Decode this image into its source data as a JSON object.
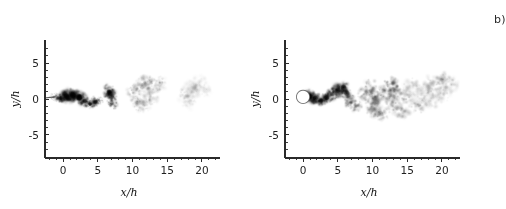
{
  "figure": {
    "type": "flow-visualization",
    "background_color": "#ffffff",
    "ink_color": "#1a1a1a"
  },
  "panels": [
    {
      "id": "a",
      "label": "a)",
      "xlabel": "x/h",
      "ylabel": "y/h",
      "xlim": [
        -2.6,
        22.6
      ],
      "ylim": [
        -8.2,
        8.2
      ],
      "xticks_major": [
        0,
        5,
        10,
        15,
        20
      ],
      "xticklabels": [
        "0",
        "5",
        "10",
        "15",
        "20"
      ],
      "xticks_minor": [
        -2,
        -1,
        1,
        2,
        3,
        4,
        6,
        7,
        8,
        9,
        11,
        12,
        13,
        14,
        16,
        17,
        18,
        19,
        21,
        22
      ],
      "yticks_major": [
        5,
        0,
        -5
      ],
      "yticklabels": [
        "5",
        "0",
        "-5"
      ],
      "yticks_minor": [
        7,
        6,
        4,
        3,
        2,
        1,
        -1,
        -2,
        -3,
        -4,
        -6,
        -7
      ],
      "origin_marker": false,
      "inlet_streak": true
    },
    {
      "id": "b",
      "label": "b)",
      "xlabel": "x/h",
      "ylabel": "y/h",
      "xlim": [
        -2.6,
        22.6
      ],
      "ylim": [
        -8.2,
        8.2
      ],
      "xticks_major": [
        0,
        5,
        10,
        15,
        20
      ],
      "xticklabels": [
        "0",
        "5",
        "10",
        "15",
        "20"
      ],
      "xticks_minor": [
        -2,
        -1,
        1,
        2,
        3,
        4,
        6,
        7,
        8,
        9,
        11,
        12,
        13,
        14,
        16,
        17,
        18,
        19,
        21,
        22
      ],
      "yticks_major": [
        5,
        0,
        -5
      ],
      "yticklabels": [
        "5",
        "0",
        "-5"
      ],
      "yticks_minor": [
        7,
        6,
        4,
        3,
        2,
        1,
        -1,
        -2,
        -3,
        -4,
        -6,
        -7
      ],
      "origin_marker": true,
      "inlet_streak": false
    }
  ],
  "chart_data": [
    {
      "type": "scatter",
      "title": "a)",
      "xlabel": "x/h",
      "ylabel": "y/h",
      "xlim": [
        -2.6,
        22.6
      ],
      "ylim": [
        -8.2,
        8.2
      ],
      "grid": false,
      "legend": "none",
      "colormap": "greyscale-inverted",
      "note": "Scalar concentration blobs; intensity 0 = white (no scalar), 1 = black (max scalar)",
      "blobs": [
        {
          "x": -1.2,
          "y": 0.3,
          "rx": 0.8,
          "ry": 0.5,
          "intensity": 0.55
        },
        {
          "x": -0.4,
          "y": 0.1,
          "rx": 0.9,
          "ry": 0.6,
          "intensity": 0.85
        },
        {
          "x": 0.5,
          "y": 0.4,
          "rx": 1.1,
          "ry": 0.9,
          "intensity": 0.97
        },
        {
          "x": 1.4,
          "y": 0.5,
          "rx": 1.2,
          "ry": 1.0,
          "intensity": 1.0
        },
        {
          "x": 2.3,
          "y": 0.2,
          "rx": 1.1,
          "ry": 0.9,
          "intensity": 0.95
        },
        {
          "x": 3.1,
          "y": -0.3,
          "rx": 0.9,
          "ry": 0.7,
          "intensity": 0.8
        },
        {
          "x": 3.9,
          "y": -0.7,
          "rx": 0.8,
          "ry": 0.6,
          "intensity": 0.72
        },
        {
          "x": 4.6,
          "y": -0.4,
          "rx": 0.7,
          "ry": 0.7,
          "intensity": 0.68
        },
        {
          "x": 5.2,
          "y": -0.2,
          "rx": 0.6,
          "ry": 0.5,
          "intensity": 0.45
        },
        {
          "x": 6.6,
          "y": 1.0,
          "rx": 0.8,
          "ry": 1.1,
          "intensity": 0.88
        },
        {
          "x": 7.0,
          "y": 0.3,
          "rx": 0.8,
          "ry": 1.0,
          "intensity": 0.8
        },
        {
          "x": 7.2,
          "y": -0.6,
          "rx": 0.7,
          "ry": 0.8,
          "intensity": 0.6
        },
        {
          "x": 10.2,
          "y": 0.9,
          "rx": 1.0,
          "ry": 1.2,
          "intensity": 0.34
        },
        {
          "x": 10.6,
          "y": -0.6,
          "rx": 1.0,
          "ry": 1.1,
          "intensity": 0.3
        },
        {
          "x": 11.3,
          "y": 1.9,
          "rx": 1.1,
          "ry": 1.0,
          "intensity": 0.3
        },
        {
          "x": 12.2,
          "y": 2.4,
          "rx": 1.2,
          "ry": 1.1,
          "intensity": 0.28
        },
        {
          "x": 13.0,
          "y": 1.6,
          "rx": 1.1,
          "ry": 1.2,
          "intensity": 0.26
        },
        {
          "x": 12.6,
          "y": 0.2,
          "rx": 1.2,
          "ry": 1.1,
          "intensity": 0.24
        },
        {
          "x": 11.6,
          "y": -0.9,
          "rx": 1.0,
          "ry": 1.0,
          "intensity": 0.24
        },
        {
          "x": 14.0,
          "y": 2.2,
          "rx": 1.0,
          "ry": 1.0,
          "intensity": 0.2
        },
        {
          "x": 17.6,
          "y": 0.6,
          "rx": 1.2,
          "ry": 1.1,
          "intensity": 0.18
        },
        {
          "x": 18.6,
          "y": 1.4,
          "rx": 1.3,
          "ry": 1.2,
          "intensity": 0.17
        },
        {
          "x": 19.6,
          "y": 2.1,
          "rx": 1.2,
          "ry": 1.2,
          "intensity": 0.15
        },
        {
          "x": 18.2,
          "y": -0.4,
          "rx": 1.1,
          "ry": 1.0,
          "intensity": 0.13
        },
        {
          "x": 20.4,
          "y": 1.2,
          "rx": 1.0,
          "ry": 1.0,
          "intensity": 0.1
        }
      ]
    },
    {
      "type": "scatter",
      "title": "b)",
      "xlabel": "x/h",
      "ylabel": "y/h",
      "xlim": [
        -2.6,
        22.6
      ],
      "ylim": [
        -8.2,
        8.2
      ],
      "grid": false,
      "legend": "none",
      "colormap": "greyscale-inverted",
      "note": "Scalar concentration blobs; white circle obstacle at origin",
      "blobs": [
        {
          "x": 0.9,
          "y": 0.4,
          "rx": 0.9,
          "ry": 0.9,
          "intensity": 1.0
        },
        {
          "x": 1.8,
          "y": 0.1,
          "rx": 0.9,
          "ry": 0.8,
          "intensity": 0.95
        },
        {
          "x": 2.6,
          "y": -0.2,
          "rx": 0.8,
          "ry": 0.7,
          "intensity": 0.88
        },
        {
          "x": 3.4,
          "y": 0.2,
          "rx": 0.8,
          "ry": 0.8,
          "intensity": 0.82
        },
        {
          "x": 4.2,
          "y": 0.7,
          "rx": 0.8,
          "ry": 0.9,
          "intensity": 0.8
        },
        {
          "x": 5.0,
          "y": 1.2,
          "rx": 0.9,
          "ry": 1.0,
          "intensity": 0.85
        },
        {
          "x": 5.8,
          "y": 1.6,
          "rx": 0.9,
          "ry": 1.0,
          "intensity": 0.8
        },
        {
          "x": 6.3,
          "y": 0.8,
          "rx": 0.9,
          "ry": 1.0,
          "intensity": 0.7
        },
        {
          "x": 6.8,
          "y": -0.3,
          "rx": 0.9,
          "ry": 0.9,
          "intensity": 0.55
        },
        {
          "x": 7.6,
          "y": -0.9,
          "rx": 0.9,
          "ry": 0.9,
          "intensity": 0.4
        },
        {
          "x": 9.0,
          "y": 0.6,
          "rx": 1.1,
          "ry": 1.2,
          "intensity": 0.45
        },
        {
          "x": 9.8,
          "y": 1.6,
          "rx": 1.1,
          "ry": 1.2,
          "intensity": 0.42
        },
        {
          "x": 10.4,
          "y": 0.0,
          "rx": 1.1,
          "ry": 1.1,
          "intensity": 0.5
        },
        {
          "x": 10.2,
          "y": -1.4,
          "rx": 1.1,
          "ry": 1.1,
          "intensity": 0.42
        },
        {
          "x": 11.4,
          "y": -2.0,
          "rx": 1.1,
          "ry": 1.0,
          "intensity": 0.35
        },
        {
          "x": 11.8,
          "y": 0.9,
          "rx": 1.1,
          "ry": 1.2,
          "intensity": 0.45
        },
        {
          "x": 12.6,
          "y": 2.0,
          "rx": 1.1,
          "ry": 1.2,
          "intensity": 0.55
        },
        {
          "x": 13.2,
          "y": 1.2,
          "rx": 1.1,
          "ry": 1.2,
          "intensity": 0.5
        },
        {
          "x": 13.0,
          "y": -0.6,
          "rx": 1.1,
          "ry": 1.1,
          "intensity": 0.4
        },
        {
          "x": 14.2,
          "y": -1.6,
          "rx": 1.2,
          "ry": 1.2,
          "intensity": 0.34
        },
        {
          "x": 15.0,
          "y": 0.2,
          "rx": 1.2,
          "ry": 1.3,
          "intensity": 0.3
        },
        {
          "x": 15.6,
          "y": 1.6,
          "rx": 1.2,
          "ry": 1.3,
          "intensity": 0.28
        },
        {
          "x": 16.6,
          "y": -0.8,
          "rx": 1.2,
          "ry": 1.3,
          "intensity": 0.28
        },
        {
          "x": 17.4,
          "y": 0.8,
          "rx": 1.2,
          "ry": 1.3,
          "intensity": 0.24
        },
        {
          "x": 18.4,
          "y": 2.0,
          "rx": 1.2,
          "ry": 1.3,
          "intensity": 0.22
        },
        {
          "x": 18.8,
          "y": 0.0,
          "rx": 1.2,
          "ry": 1.3,
          "intensity": 0.22
        },
        {
          "x": 20.0,
          "y": 2.6,
          "rx": 1.2,
          "ry": 1.2,
          "intensity": 0.28
        },
        {
          "x": 20.4,
          "y": 1.0,
          "rx": 1.2,
          "ry": 1.3,
          "intensity": 0.2
        },
        {
          "x": 21.2,
          "y": 2.0,
          "rx": 1.1,
          "ry": 1.2,
          "intensity": 0.16
        }
      ]
    }
  ]
}
